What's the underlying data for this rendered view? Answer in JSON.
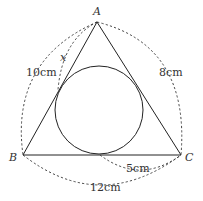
{
  "diagram": {
    "type": "triangle-with-incircle",
    "vertices": {
      "A": {
        "label": "A",
        "x": 97,
        "y": 22
      },
      "B": {
        "label": "B",
        "x": 23,
        "y": 155
      },
      "C": {
        "label": "C",
        "x": 181,
        "y": 155
      }
    },
    "incircle": {
      "cx": 99,
      "cy": 110,
      "r": 44
    },
    "measurements": {
      "AB": "10cm",
      "AC": "8cm",
      "BC": "12cm",
      "tangent_to_C": "5cm",
      "unknown": "x"
    },
    "colors": {
      "line": "#222222",
      "text": "#333333",
      "background": "#ffffff"
    }
  }
}
